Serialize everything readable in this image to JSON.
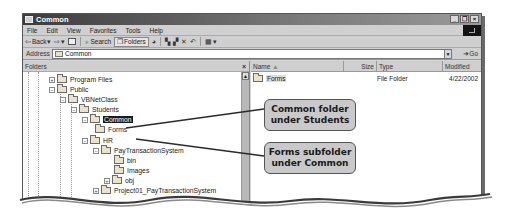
{
  "window": {
    "title": "Common",
    "controls": [
      "minimize",
      "restore",
      "close"
    ]
  },
  "menubar": {
    "items": [
      "File",
      "Edit",
      "View",
      "Favorites",
      "Tools",
      "Help"
    ]
  },
  "toolbar": {
    "back_label": "Back",
    "search_label": "Search",
    "folders_label": "Folders",
    "icons": [
      "back-icon",
      "forward-icon",
      "up-folder-icon",
      "search-icon",
      "folders-icon",
      "history-icon",
      "move-to-icon",
      "copy-to-icon",
      "delete-icon",
      "undo-icon",
      "views-icon"
    ]
  },
  "addressbar": {
    "label": "Address",
    "value": "Common",
    "go_label": "Go"
  },
  "folders_pane": {
    "title": "Folders",
    "close_glyph": "×",
    "tree": [
      {
        "label": "Program Files",
        "depth": 0,
        "expander": "+"
      },
      {
        "label": "Public",
        "depth": 0,
        "expander": "−"
      },
      {
        "label": "VBNetClass",
        "depth": 1,
        "expander": "−"
      },
      {
        "label": "Students",
        "depth": 2,
        "expander": "−"
      },
      {
        "label": "Common",
        "depth": 3,
        "expander": "−",
        "selected": true
      },
      {
        "label": "Forms",
        "depth": 4,
        "expander": ""
      },
      {
        "label": "HR",
        "depth": 2,
        "expander": "−"
      },
      {
        "label": "PayTransactionSystem",
        "depth": 3,
        "expander": "−"
      },
      {
        "label": "bin",
        "depth": 4,
        "expander": ""
      },
      {
        "label": "Images",
        "depth": 4,
        "expander": ""
      },
      {
        "label": "obj",
        "depth": 4,
        "expander": "+"
      },
      {
        "label": "Project01_PayTransactionSystem",
        "depth": 2,
        "expander": "+"
      }
    ]
  },
  "content_pane": {
    "columns": [
      {
        "label": "Name",
        "sort_glyph": "▲"
      },
      {
        "label": "Size"
      },
      {
        "label": "Type"
      },
      {
        "label": "Modified"
      }
    ],
    "rows": [
      {
        "name": "Forms",
        "size": "",
        "type": "File Folder",
        "modified": "4/22/2002"
      }
    ]
  },
  "callouts": [
    {
      "line1": "Common folder",
      "line2": "under Students"
    },
    {
      "line1": "Forms subfolder",
      "line2": "under Common"
    }
  ]
}
